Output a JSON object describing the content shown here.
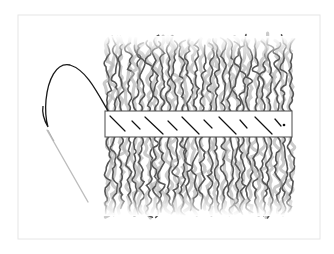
{
  "figure": {
    "width": 334,
    "height": 254,
    "background": "#ffffff",
    "frame": {
      "x": 18,
      "y": 15,
      "w": 302,
      "h": 224,
      "stroke": "#e6e6e6"
    },
    "weft_band": {
      "x": 105,
      "y": 111,
      "w": 187,
      "h": 26,
      "fill": "#ffffff",
      "stroke": "#4a4a4a"
    },
    "stitches": [
      {
        "x1": 110,
        "y1": 116,
        "x2": 125,
        "y2": 131
      },
      {
        "x1": 132,
        "y1": 121,
        "x2": 140,
        "y2": 129
      },
      {
        "x1": 145,
        "y1": 117,
        "x2": 163,
        "y2": 134
      },
      {
        "x1": 168,
        "y1": 121,
        "x2": 177,
        "y2": 130
      },
      {
        "x1": 182,
        "y1": 117,
        "x2": 199,
        "y2": 134
      },
      {
        "x1": 204,
        "y1": 120,
        "x2": 212,
        "y2": 128
      },
      {
        "x1": 219,
        "y1": 117,
        "x2": 236,
        "y2": 134
      },
      {
        "x1": 240,
        "y1": 120,
        "x2": 247,
        "y2": 128
      },
      {
        "x1": 255,
        "y1": 117,
        "x2": 272,
        "y2": 134
      },
      {
        "x1": 275,
        "y1": 119,
        "x2": 281,
        "y2": 126
      }
    ],
    "knot": {
      "x": 284,
      "y": 125,
      "r": 1.3
    },
    "hair": {
      "color_dark": "#555555",
      "color_light": "#b5b5b5",
      "strand_count": 28,
      "x_start": 108,
      "x_end": 290,
      "top_y": 40,
      "bottom_y": 212,
      "upper_strand_end": 111,
      "lower_strand_start": 137
    },
    "thread": {
      "stroke": "#1a1a1a",
      "path": "M 108 111 C 96 90, 86 70, 70 65 C 56 62, 48 80, 46 100 C 45 111, 46 120, 48 127 C 44 120, 42 112, 43 106"
    },
    "needle": {
      "x1": 47,
      "y1": 130,
      "x2": 88,
      "y2": 202,
      "stroke": "#bdbdbd",
      "eye_stroke": "#9a9a9a"
    }
  }
}
